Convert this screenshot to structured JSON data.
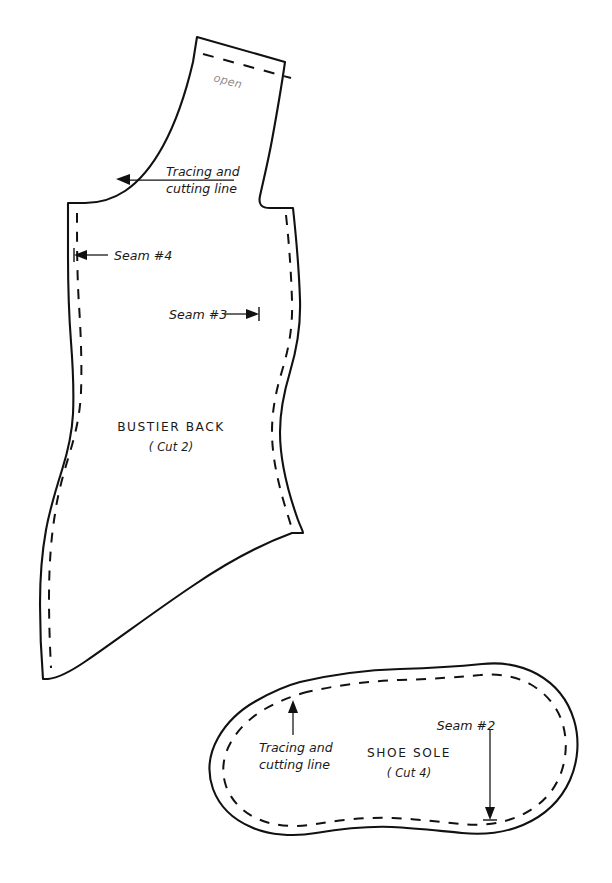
{
  "document": {
    "kind": "sewing-pattern-sheet",
    "background_color": "#ffffff",
    "ink_color": "#111111",
    "muted_ink_color": "#8d8d8d",
    "width": 612,
    "height": 883
  },
  "pieces": [
    {
      "id": "bustier-back",
      "title": "BUSTIER BACK",
      "cut_note": "( Cut 2)",
      "open_label": "open",
      "annotations": [
        {
          "id": "tracing-cutting-line-bustier",
          "line1": "Tracing and",
          "line2": "cutting line"
        },
        {
          "id": "seam-4",
          "text": "Seam #4"
        },
        {
          "id": "seam-3",
          "text": "Seam #3"
        }
      ]
    },
    {
      "id": "shoe-sole",
      "title": "SHOE SOLE",
      "cut_note": "( Cut 4)",
      "annotations": [
        {
          "id": "tracing-cutting-line-sole",
          "line1": "Tracing and",
          "line2": "cutting line"
        },
        {
          "id": "seam-2",
          "text": "Seam #2"
        }
      ]
    }
  ],
  "labels": {
    "bustier_title": "BUSTIER BACK",
    "bustier_cut": "( Cut 2)",
    "bustier_open": "open",
    "bustier_tracing_l1": "Tracing and",
    "bustier_tracing_l2": "cutting line",
    "seam4": "Seam #4",
    "seam3": "Seam #3",
    "sole_title": "SHOE SOLE",
    "sole_cut": "( Cut 4)",
    "sole_tracing_l1": "Tracing and",
    "sole_tracing_l2": "cutting line",
    "seam2": "Seam #2"
  }
}
